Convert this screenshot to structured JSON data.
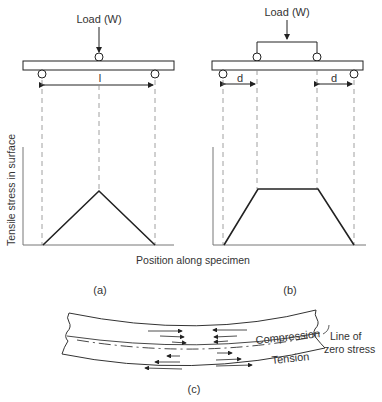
{
  "diagram_a": {
    "load_label": "Load (W)",
    "span_label": "l",
    "caption": "(a)"
  },
  "diagram_b": {
    "load_label": "Load (W)",
    "left_dist_label": "d",
    "right_dist_label": "d",
    "caption": "(b)"
  },
  "axes": {
    "ylabel": "Tensile stress in surface",
    "xlabel": "Position along specimen"
  },
  "diagram_c": {
    "compression_label": "Compression",
    "tension_label": "Tension",
    "neutral_label_line1": "Line of",
    "neutral_label_line2": "zero stress",
    "caption": "(c)"
  },
  "colors": {
    "stroke": "#222222",
    "dashed": "#888888",
    "axis": "#777777"
  }
}
